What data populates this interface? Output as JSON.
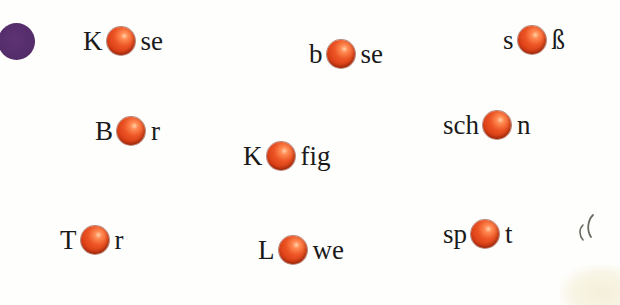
{
  "exercise": {
    "marker_color": "#552d6b",
    "ball_color": "#e04a1c",
    "missing_letter_hint": "umlaut",
    "words": [
      {
        "pre": "K",
        "post": "se",
        "answer": "Käse"
      },
      {
        "pre": "b",
        "post": "se",
        "answer": "böse"
      },
      {
        "pre": "s",
        "post": "ß",
        "answer": "süß"
      },
      {
        "pre": "B",
        "post": "r",
        "answer": "Bär"
      },
      {
        "pre": "sch",
        "post": "n",
        "answer": "schön"
      },
      {
        "pre": "K",
        "post": "fig",
        "answer": "Käfig"
      },
      {
        "pre": "T",
        "post": "r",
        "answer": "Tür"
      },
      {
        "pre": "L",
        "post": "we",
        "answer": "Löwe"
      },
      {
        "pre": "sp",
        "post": "t",
        "answer": "spät"
      }
    ]
  }
}
